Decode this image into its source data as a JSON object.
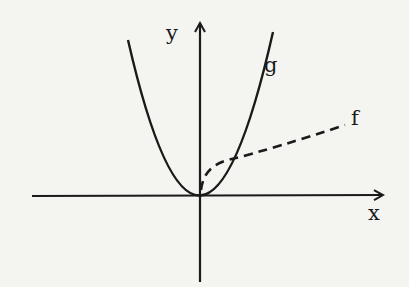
{
  "diagram": {
    "type": "function-graph",
    "axes": {
      "x_label": "x",
      "y_label": "y"
    },
    "curves": [
      {
        "label": "g",
        "style": "solid",
        "shape": "parabola through origin (y = k·x²)"
      },
      {
        "label": "f",
        "style": "dashed",
        "shape": "square-root-like curve from origin (x ≥ 0)"
      }
    ],
    "colors": {
      "background": "#f4f4f1",
      "ink": "#1a1a1a"
    }
  }
}
